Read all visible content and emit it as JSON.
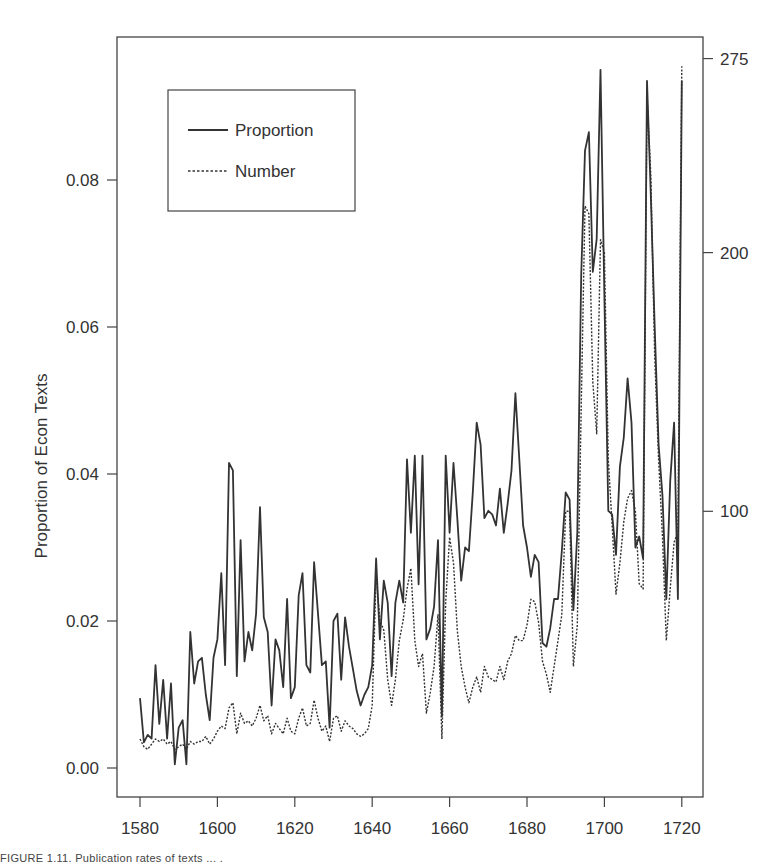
{
  "chart_data": {
    "type": "line",
    "title": "",
    "xlabel": "",
    "ylabel": "Proportion of Econ Texts",
    "ylabel_right": "",
    "xlim": [
      1574,
      1725
    ],
    "ylim": [
      -0.004,
      0.1
    ],
    "ylim_right": [
      0,
      285
    ],
    "x_ticks": [
      1580,
      1600,
      1620,
      1640,
      1660,
      1680,
      1700,
      1720
    ],
    "y_ticks": [
      "0.00",
      "0.02",
      "0.04",
      "0.06",
      "0.08"
    ],
    "y_ticks_right": [
      "100",
      "200",
      "275"
    ],
    "grid": false,
    "legend_position": "upper-left",
    "legend": [
      "Proportion",
      "Number"
    ],
    "x": [
      1580,
      1581,
      1582,
      1583,
      1584,
      1585,
      1586,
      1587,
      1588,
      1589,
      1590,
      1591,
      1592,
      1593,
      1594,
      1595,
      1596,
      1597,
      1598,
      1599,
      1600,
      1601,
      1602,
      1603,
      1604,
      1605,
      1606,
      1607,
      1608,
      1609,
      1610,
      1611,
      1612,
      1613,
      1614,
      1615,
      1616,
      1617,
      1618,
      1619,
      1620,
      1621,
      1622,
      1623,
      1624,
      1625,
      1626,
      1627,
      1628,
      1629,
      1630,
      1631,
      1632,
      1633,
      1634,
      1635,
      1636,
      1637,
      1638,
      1639,
      1640,
      1641,
      1642,
      1643,
      1644,
      1645,
      1646,
      1647,
      1648,
      1649,
      1650,
      1651,
      1652,
      1653,
      1654,
      1655,
      1656,
      1657,
      1658,
      1659,
      1660,
      1661,
      1662,
      1663,
      1664,
      1665,
      1666,
      1667,
      1668,
      1669,
      1670,
      1671,
      1672,
      1673,
      1674,
      1675,
      1676,
      1677,
      1678,
      1679,
      1680,
      1681,
      1682,
      1683,
      1684,
      1685,
      1686,
      1687,
      1688,
      1689,
      1690,
      1691,
      1692,
      1693,
      1694,
      1695,
      1696,
      1697,
      1698,
      1699,
      1700,
      1701,
      1702,
      1703,
      1704,
      1705,
      1706,
      1707,
      1708,
      1709,
      1710,
      1711,
      1712,
      1713,
      1714,
      1715,
      1716,
      1717,
      1718,
      1719,
      1720
    ],
    "series": [
      {
        "name": "Proportion",
        "axis": "left",
        "style": "solid",
        "values": [
          0.0095,
          0.0035,
          0.0045,
          0.004,
          0.014,
          0.006,
          0.012,
          0.004,
          0.0115,
          0.0005,
          0.0055,
          0.0065,
          0.0005,
          0.0185,
          0.0115,
          0.0145,
          0.015,
          0.01,
          0.0065,
          0.015,
          0.0175,
          0.0265,
          0.014,
          0.0415,
          0.0405,
          0.0125,
          0.031,
          0.0145,
          0.0185,
          0.016,
          0.021,
          0.0355,
          0.0205,
          0.0185,
          0.0085,
          0.0175,
          0.016,
          0.011,
          0.023,
          0.0095,
          0.011,
          0.0235,
          0.0265,
          0.014,
          0.013,
          0.028,
          0.021,
          0.014,
          0.0145,
          0.0055,
          0.02,
          0.021,
          0.012,
          0.0205,
          0.0165,
          0.0135,
          0.0105,
          0.0085,
          0.01,
          0.011,
          0.014,
          0.0285,
          0.0175,
          0.0255,
          0.0225,
          0.0125,
          0.0225,
          0.0255,
          0.0225,
          0.042,
          0.032,
          0.0425,
          0.025,
          0.0425,
          0.0175,
          0.019,
          0.022,
          0.031,
          0.007,
          0.0425,
          0.032,
          0.0415,
          0.034,
          0.0255,
          0.03,
          0.0295,
          0.0375,
          0.047,
          0.044,
          0.034,
          0.035,
          0.0345,
          0.033,
          0.038,
          0.032,
          0.036,
          0.0405,
          0.051,
          0.042,
          0.033,
          0.03,
          0.026,
          0.029,
          0.028,
          0.017,
          0.0165,
          0.019,
          0.023,
          0.023,
          0.0295,
          0.0375,
          0.0365,
          0.0215,
          0.032,
          0.067,
          0.084,
          0.0865,
          0.0675,
          0.072,
          0.095,
          0.064,
          0.035,
          0.0345,
          0.029,
          0.041,
          0.045,
          0.053,
          0.047,
          0.03,
          0.0315,
          0.0285,
          0.0935,
          0.078,
          0.06,
          0.044,
          0.037,
          0.023,
          0.039,
          0.047,
          0.023,
          0.0935
        ]
      },
      {
        "name": "Number",
        "axis": "right",
        "style": "dashed",
        "values": [
          12,
          9,
          8,
          10,
          12,
          11,
          12,
          10,
          11,
          8,
          9,
          10,
          8,
          11,
          10,
          11,
          11,
          13,
          10,
          12,
          15,
          17,
          16,
          24,
          26,
          14,
          22,
          18,
          19,
          17,
          20,
          25,
          19,
          21,
          14,
          18,
          16,
          14,
          20,
          15,
          14,
          20,
          24,
          17,
          18,
          27,
          20,
          15,
          17,
          11,
          20,
          21,
          15,
          19,
          17,
          16,
          14,
          13,
          14,
          16,
          25,
          75,
          58,
          54,
          35,
          25,
          35,
          50,
          58,
          70,
          78,
          50,
          40,
          45,
          22,
          30,
          40,
          60,
          12,
          65,
          90,
          80,
          54,
          40,
          32,
          26,
          32,
          36,
          30,
          40,
          36,
          35,
          34,
          40,
          35,
          42,
          45,
          52,
          50,
          50,
          56,
          66,
          65,
          57,
          42,
          37,
          30,
          40,
          50,
          60,
          100,
          100,
          40,
          56,
          140,
          218,
          215,
          150,
          130,
          205,
          200,
          120,
          95,
          68,
          80,
          96,
          105,
          108,
          100,
          72,
          70,
          260,
          230,
          160,
          120,
          90,
          50,
          70,
          88,
          92,
          272
        ]
      }
    ],
    "caption": "FIGURE 1.11. Publication rates of texts ... ."
  }
}
